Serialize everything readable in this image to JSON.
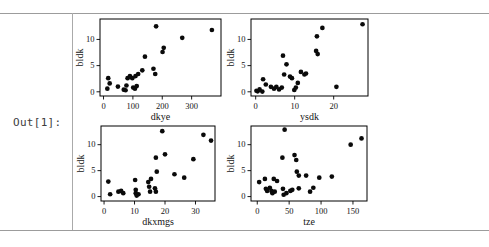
{
  "out_label": "Out[1]:",
  "colors": {
    "background": "#ffffff",
    "rule": "#9c9c9c",
    "plot_frame": "#000000",
    "point": "#0a0a0a",
    "out_label": "#3d3d3d"
  },
  "chart_data": [
    {
      "type": "scatter",
      "title": "",
      "xlabel": "dkye",
      "ylabel": "bldk",
      "xticks": [
        0,
        100,
        200,
        300
      ],
      "yticks": [
        0,
        5,
        10
      ],
      "xlim": [
        -12,
        400
      ],
      "ylim": [
        -0.8,
        13.9
      ],
      "grid": false,
      "legend": false,
      "points": [
        [
          13,
          0.6
        ],
        [
          21,
          1.6
        ],
        [
          16,
          2.6
        ],
        [
          49,
          1.0
        ],
        [
          69,
          0.4
        ],
        [
          75,
          0.3
        ],
        [
          78,
          1.2
        ],
        [
          82,
          2.6
        ],
        [
          90,
          3.0
        ],
        [
          98,
          2.6
        ],
        [
          101,
          0.8
        ],
        [
          107,
          0.6
        ],
        [
          113,
          1.1
        ],
        [
          109,
          3.0
        ],
        [
          118,
          3.4
        ],
        [
          132,
          4.1
        ],
        [
          141,
          6.7
        ],
        [
          170,
          4.4
        ],
        [
          176,
          3.4
        ],
        [
          179,
          12.5
        ],
        [
          201,
          7.6
        ],
        [
          205,
          8.4
        ],
        [
          268,
          10.3
        ],
        [
          369,
          11.8
        ]
      ]
    },
    {
      "type": "scatter",
      "title": "",
      "xlabel": "ysdk",
      "ylabel": "bldk",
      "xticks": [
        0,
        10,
        20
      ],
      "yticks": [
        0,
        5,
        10
      ],
      "xlim": [
        -1.2,
        28.8
      ],
      "ylim": [
        -0.8,
        13.9
      ],
      "grid": false,
      "legend": false,
      "points": [
        [
          0.2,
          0.2
        ],
        [
          0.5,
          0.1
        ],
        [
          1.0,
          0.45
        ],
        [
          1.7,
          0.05
        ],
        [
          1.9,
          2.4
        ],
        [
          2.6,
          1.4
        ],
        [
          3.9,
          0.95
        ],
        [
          4.7,
          0.6
        ],
        [
          5.3,
          0.95
        ],
        [
          6.0,
          0.45
        ],
        [
          6.7,
          0.8
        ],
        [
          7.0,
          6.9
        ],
        [
          7.3,
          3.3
        ],
        [
          7.9,
          5.25
        ],
        [
          8.8,
          2.9
        ],
        [
          9.3,
          2.6
        ],
        [
          9.9,
          0.35
        ],
        [
          10.3,
          0.8
        ],
        [
          10.8,
          1.7
        ],
        [
          11.6,
          3.8
        ],
        [
          12.5,
          3.3
        ],
        [
          12.9,
          3.5
        ],
        [
          15.5,
          7.8
        ],
        [
          15.9,
          7.2
        ],
        [
          15.7,
          10.6
        ],
        [
          17.1,
          12.2
        ],
        [
          20.7,
          0.95
        ],
        [
          27.4,
          12.9
        ]
      ]
    },
    {
      "type": "scatter",
      "title": "",
      "xlabel": "dkxmgs",
      "ylabel": "bldk",
      "xticks": [
        0,
        10,
        20,
        30
      ],
      "yticks": [
        0,
        5,
        10
      ],
      "xlim": [
        -1,
        36.4
      ],
      "ylim": [
        -0.85,
        13.6
      ],
      "grid": false,
      "legend": false,
      "points": [
        [
          1.4,
          2.9
        ],
        [
          2.0,
          0.45
        ],
        [
          4.7,
          0.95
        ],
        [
          5.6,
          1.1
        ],
        [
          6.3,
          0.65
        ],
        [
          10.2,
          3.2
        ],
        [
          10.4,
          1.3
        ],
        [
          10.4,
          0.65
        ],
        [
          10.7,
          0.2
        ],
        [
          11.3,
          0.45
        ],
        [
          14.5,
          2.8
        ],
        [
          14.8,
          1.9
        ],
        [
          15.1,
          0.95
        ],
        [
          15.4,
          3.4
        ],
        [
          16.7,
          1.6
        ],
        [
          17.0,
          0.95
        ],
        [
          17.3,
          4.8
        ],
        [
          17.0,
          7.5
        ],
        [
          19.1,
          12.6
        ],
        [
          20.0,
          8.15
        ],
        [
          23.1,
          4.3
        ],
        [
          26.3,
          3.65
        ],
        [
          29.3,
          7.2
        ],
        [
          32.6,
          11.9
        ],
        [
          35.1,
          10.8
        ]
      ]
    },
    {
      "type": "scatter",
      "title": "",
      "xlabel": "tze",
      "ylabel": "bldk",
      "xticks": [
        0,
        50,
        100,
        150
      ],
      "yticks": [
        0,
        5,
        10
      ],
      "xlim": [
        -9.8,
        172
      ],
      "ylim": [
        -0.85,
        13.6
      ],
      "grid": false,
      "legend": false,
      "points": [
        [
          3,
          2.8
        ],
        [
          12,
          3.4
        ],
        [
          13.5,
          1.5
        ],
        [
          15.5,
          1.1
        ],
        [
          19.7,
          1.7
        ],
        [
          22.3,
          1.1
        ],
        [
          23.8,
          0.65
        ],
        [
          25.9,
          3.4
        ],
        [
          27.4,
          0.95
        ],
        [
          31,
          3.0
        ],
        [
          39.4,
          7.5
        ],
        [
          40.3,
          1.5
        ],
        [
          41.4,
          0.35
        ],
        [
          42.9,
          12.9
        ],
        [
          45.6,
          0.65
        ],
        [
          51.8,
          1.1
        ],
        [
          54.9,
          1.3
        ],
        [
          58.4,
          8.0
        ],
        [
          61.1,
          7.05
        ],
        [
          62,
          4.8
        ],
        [
          65.1,
          4.05
        ],
        [
          65.1,
          1.6
        ],
        [
          76.6,
          4.05
        ],
        [
          82.8,
          0.95
        ],
        [
          87.9,
          1.7
        ],
        [
          97.2,
          3.65
        ],
        [
          116.9,
          3.85
        ],
        [
          146.4,
          10.0
        ],
        [
          163.4,
          11.2
        ]
      ]
    }
  ]
}
